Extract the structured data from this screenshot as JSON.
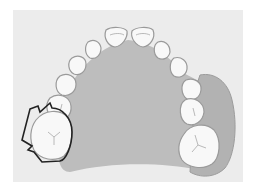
{
  "figure": {
    "colors": {
      "background": "#ffffff",
      "panel": "#ececec",
      "palate": "#bdbdbd",
      "gingiva_right": "#b2b2b2",
      "tooth_fill": "#f8f8f8",
      "tooth_stroke": "#9a9a9a",
      "outline": "#222222"
    }
  }
}
